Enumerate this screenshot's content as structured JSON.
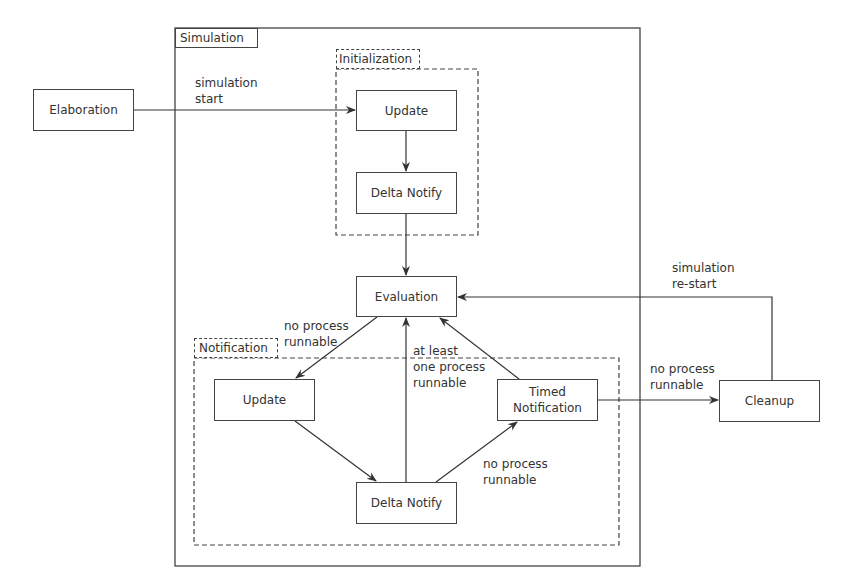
{
  "diagram": {
    "containers": {
      "simulation": "Simulation",
      "initialization": "Initialization",
      "notification": "Notification"
    },
    "nodes": {
      "elaboration": "Elaboration",
      "init_update": "Update",
      "init_delta_notify": "Delta Notify",
      "evaluation": "Evaluation",
      "notif_update": "Update",
      "notif_delta_notify": "Delta Notify",
      "timed_notification": "Timed\nNotification",
      "cleanup": "Cleanup"
    },
    "edge_labels": {
      "simulation_start": "simulation\nstart",
      "eval_no_process": "no process\nrunnable",
      "at_least_one": "at least\none process\nrunnable",
      "delta_no_process": "no process\nrunnable",
      "timed_no_process": "no process\nrunnable",
      "simulation_restart": "simulation\nre-start"
    },
    "edges": [
      {
        "from": "Elaboration",
        "to": "Initialization.Update",
        "label": "simulation start"
      },
      {
        "from": "Initialization.Update",
        "to": "Initialization.Delta Notify"
      },
      {
        "from": "Initialization.Delta Notify",
        "to": "Evaluation"
      },
      {
        "from": "Evaluation",
        "to": "Notification.Update",
        "label": "no process runnable"
      },
      {
        "from": "Notification.Update",
        "to": "Notification.Delta Notify"
      },
      {
        "from": "Notification.Delta Notify",
        "to": "Evaluation",
        "label": "at least one process runnable"
      },
      {
        "from": "Notification.Delta Notify",
        "to": "Timed Notification",
        "label": "no process runnable"
      },
      {
        "from": "Timed Notification",
        "to": "Evaluation"
      },
      {
        "from": "Timed Notification",
        "to": "Cleanup",
        "label": "no process runnable"
      },
      {
        "from": "Cleanup",
        "to": "Evaluation",
        "label": "simulation re-start"
      }
    ]
  }
}
